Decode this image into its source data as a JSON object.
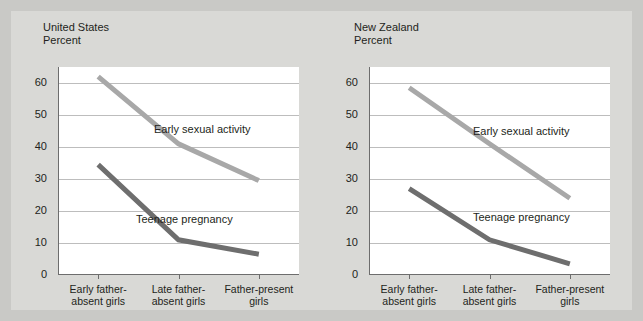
{
  "chart_data": [
    {
      "type": "line",
      "title": "United States",
      "ylabel": "Percent",
      "xlabel": "",
      "categories": [
        "Early father-\nabsent girls",
        "Late father-\nabsent girls",
        "Father-present\ngirls"
      ],
      "yticks": [
        0,
        10,
        20,
        30,
        40,
        50,
        60
      ],
      "ylim": [
        0,
        65
      ],
      "grid": true,
      "legend_position": "inline-annotations",
      "series": [
        {
          "name": "Early sexual activity",
          "values": [
            62,
            41,
            29.5
          ],
          "color": "#a8a8a8"
        },
        {
          "name": "Teenage pregnancy",
          "values": [
            34.5,
            11,
            6.5
          ],
          "color": "#6e6e6e"
        }
      ]
    },
    {
      "type": "line",
      "title": "New Zealand",
      "ylabel": "Percent",
      "xlabel": "",
      "categories": [
        "Early father-\nabsent girls",
        "Late father-\nabsent girls",
        "Father-present\ngirls"
      ],
      "yticks": [
        0,
        10,
        20,
        30,
        40,
        50,
        60
      ],
      "ylim": [
        0,
        65
      ],
      "grid": true,
      "legend_position": "inline-annotations",
      "series": [
        {
          "name": "Early sexual activity",
          "values": [
            58.5,
            41,
            24
          ],
          "color": "#a8a8a8"
        },
        {
          "name": "Teenage pregnancy",
          "values": [
            27,
            11,
            3.5
          ],
          "color": "#6e6e6e"
        }
      ]
    }
  ],
  "colors": {
    "page_background": "#c9c9c6",
    "figure_background": "#d9d9d6",
    "plot_background": "#ffffff",
    "gridline": "#bdbdbd",
    "axis": "#6d6d6d",
    "early_sexual_activity": "#a8a8a8",
    "teenage_pregnancy": "#6e6e6e",
    "text": "#231f20"
  }
}
